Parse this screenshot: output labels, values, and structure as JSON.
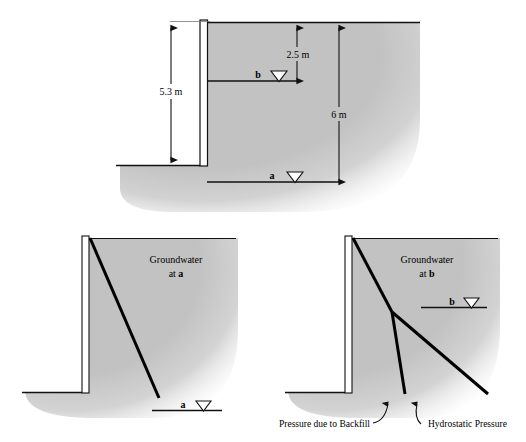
{
  "page": {
    "header_left": "",
    "header_right": ""
  },
  "colors": {
    "soil_fill": "#c2c2c2",
    "soil_fill_light": "#cdcdcd",
    "line": "#000000",
    "wall_fill": "#ffffff",
    "dim_line": "#1a1a1a",
    "background": "#ffffff"
  },
  "figures": {
    "top": {
      "name": "section-with-dimensions",
      "dimensions": [
        {
          "id": "wall-height",
          "label": "5.3 m",
          "value": 5.3,
          "unit": "m"
        },
        {
          "id": "depth-to-b",
          "label": "2.5 m",
          "value": 2.5,
          "unit": "m"
        },
        {
          "id": "total-depth",
          "label": "6 m",
          "value": 6,
          "unit": "m"
        }
      ],
      "water_levels": [
        {
          "id": "level-b",
          "label": "b",
          "symbol": "groundwater-triangle"
        },
        {
          "id": "level-a",
          "label": "a",
          "symbol": "groundwater-triangle"
        }
      ]
    },
    "bottom_left": {
      "name": "pressure-diagram-groundwater-at-a",
      "caption_line1": "Groundwater",
      "caption_line2": "at a",
      "caption_bold_token": "a",
      "water_level": {
        "label": "a",
        "symbol": "groundwater-triangle"
      }
    },
    "bottom_right": {
      "name": "pressure-diagram-groundwater-at-b",
      "caption_line1": "Groundwater",
      "caption_line2": "at b",
      "caption_bold_token": "b",
      "water_level": {
        "label": "b",
        "symbol": "groundwater-triangle"
      },
      "annotations": [
        {
          "id": "backfill-pressure",
          "label": "Pressure due to Backfill"
        },
        {
          "id": "hydrostatic-pressure",
          "label": "Hydrostatic Pressure"
        }
      ]
    }
  }
}
